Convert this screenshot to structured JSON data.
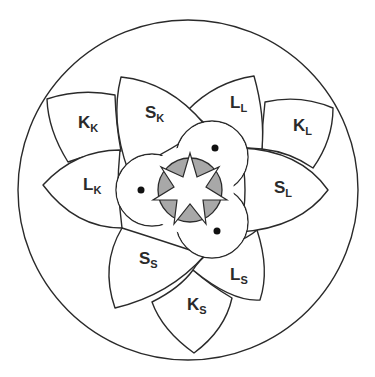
{
  "diagram": {
    "type": "flower-mandala",
    "colors": {
      "stroke": "#2a2a2a",
      "background": "#ffffff",
      "center_fill": "#a8a8a8"
    },
    "petals": [
      {
        "id": "kk",
        "main": "K",
        "sub": "K"
      },
      {
        "id": "sk",
        "main": "S",
        "sub": "K"
      },
      {
        "id": "ll",
        "main": "L",
        "sub": "L"
      },
      {
        "id": "kl",
        "main": "K",
        "sub": "L"
      },
      {
        "id": "lk",
        "main": "L",
        "sub": "K"
      },
      {
        "id": "sl",
        "main": "S",
        "sub": "L"
      },
      {
        "id": "ss",
        "main": "S",
        "sub": "S"
      },
      {
        "id": "ls",
        "main": "L",
        "sub": "S"
      },
      {
        "id": "ks",
        "main": "K",
        "sub": "S"
      }
    ],
    "center": {
      "trefoil_lobes": 3,
      "dots": 3,
      "star_points": 7
    }
  }
}
